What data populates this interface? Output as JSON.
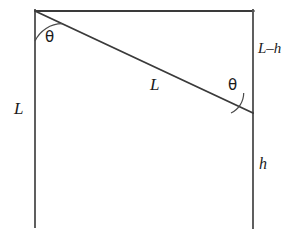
{
  "figure": {
    "type": "geometry-diagram",
    "background_color": "#ffffff",
    "stroke_color": "#3a3a3a",
    "stroke_width": 1.6,
    "labels": {
      "left_side": "L",
      "hypotenuse": "L",
      "upper_right_side": "L–h",
      "lower_right_side": "h",
      "angle_top_left": "θ",
      "angle_right": "θ"
    },
    "geometry": {
      "top_left": [
        35,
        11
      ],
      "top_right": [
        253,
        11
      ],
      "bottom_left": [
        35,
        227
      ],
      "bottom_right": [
        253,
        228
      ],
      "hypotenuse_start": [
        35,
        11
      ],
      "hypotenuse_end": [
        253,
        113
      ],
      "arc_top_left": {
        "center": [
          35,
          11
        ],
        "radius": 30,
        "from_angle_deg": 90,
        "to_angle_deg": 25
      },
      "arc_right": {
        "center": [
          253,
          113
        ],
        "radius": 22,
        "from_angle_deg": 180,
        "to_angle_deg": 115
      }
    }
  }
}
